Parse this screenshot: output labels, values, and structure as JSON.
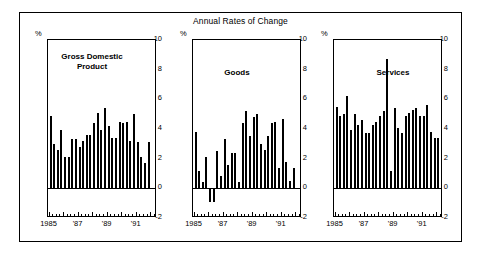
{
  "figure": {
    "title": "Annual Rates of Change",
    "axis_unit_label": "%"
  },
  "chart_data": [
    {
      "type": "bar",
      "title": "Gross Domestic Product",
      "panel_label": "Gross Domestic\nProduct",
      "xlabel": "",
      "ylabel": "%",
      "ylim": [
        -2,
        10
      ],
      "yticks": [
        -2,
        0,
        2,
        4,
        6,
        8,
        10
      ],
      "ytick_labels": [
        "-2",
        "0",
        "2",
        "4",
        "6",
        "8",
        "10"
      ],
      "xlim": [
        1985.0,
        1992.5
      ],
      "xtick_labels": [
        "1985",
        "'87",
        "'89",
        "'91"
      ],
      "xtick_values": [
        1985,
        1987,
        1989,
        1991
      ],
      "grid": false,
      "legend": "none",
      "x": [
        1985.0,
        1985.25,
        1985.5,
        1985.75,
        1986.0,
        1986.25,
        1986.5,
        1986.75,
        1987.0,
        1987.25,
        1987.5,
        1987.75,
        1988.0,
        1988.25,
        1988.5,
        1988.75,
        1989.0,
        1989.25,
        1989.5,
        1989.75,
        1990.0,
        1990.25,
        1990.5,
        1990.75,
        1991.0,
        1991.25,
        1991.5,
        1991.75,
        1992.0,
        1992.25
      ],
      "values": [
        4.9,
        3.0,
        2.6,
        3.9,
        2.1,
        2.1,
        3.3,
        3.3,
        2.8,
        3.2,
        3.6,
        3.6,
        4.4,
        5.1,
        3.9,
        5.4,
        4.2,
        3.4,
        3.4,
        4.5,
        4.4,
        4.5,
        3.2,
        5.0,
        3.1,
        2.1,
        1.7,
        3.1,
        0,
        0
      ]
    },
    {
      "type": "bar",
      "title": "Goods",
      "panel_label": "Goods",
      "xlabel": "",
      "ylabel": "%",
      "ylim": [
        -2,
        10
      ],
      "yticks": [
        -2,
        0,
        2,
        4,
        6,
        8,
        10
      ],
      "ytick_labels": [
        "-2",
        "0",
        "2",
        "4",
        "6",
        "8",
        "10"
      ],
      "xlim": [
        1985.0,
        1992.5
      ],
      "xtick_labels": [
        "1985",
        "'87",
        "'89",
        "'91"
      ],
      "xtick_values": [
        1985,
        1987,
        1989,
        1991
      ],
      "grid": false,
      "legend": "none",
      "x": [
        1985.0,
        1985.25,
        1985.5,
        1985.75,
        1986.0,
        1986.25,
        1986.5,
        1986.75,
        1987.0,
        1987.25,
        1987.5,
        1987.75,
        1988.0,
        1988.25,
        1988.5,
        1988.75,
        1989.0,
        1989.25,
        1989.5,
        1989.75,
        1990.0,
        1990.25,
        1990.5,
        1990.75,
        1991.0,
        1991.25,
        1991.5,
        1991.75,
        1992.0,
        1992.25
      ],
      "values": [
        3.8,
        1.2,
        0.4,
        2.1,
        -0.9,
        -0.9,
        2.5,
        0.8,
        3.3,
        1.6,
        2.4,
        2.4,
        0.4,
        4.4,
        5.2,
        3.5,
        4.8,
        5.0,
        3.0,
        2.6,
        3.5,
        4.4,
        4.5,
        1.4,
        4.7,
        1.8,
        0.5,
        1.4,
        0,
        0
      ]
    },
    {
      "type": "bar",
      "title": "Services",
      "panel_label": "Services",
      "xlabel": "",
      "ylabel": "%",
      "ylim": [
        -2,
        10
      ],
      "yticks": [
        -2,
        0,
        2,
        4,
        6,
        8,
        10
      ],
      "ytick_labels": [
        "-2",
        "0",
        "2",
        "4",
        "6",
        "8",
        "10"
      ],
      "xlim": [
        1985.0,
        1992.5
      ],
      "xtick_labels": [
        "1985",
        "'87",
        "'89",
        "'91"
      ],
      "xtick_values": [
        1985,
        1987,
        1989,
        1991
      ],
      "grid": false,
      "legend": "none",
      "x": [
        1985.0,
        1985.25,
        1985.5,
        1985.75,
        1986.0,
        1986.25,
        1986.5,
        1986.75,
        1987.0,
        1987.25,
        1987.5,
        1987.75,
        1988.0,
        1988.25,
        1988.5,
        1988.75,
        1989.0,
        1989.25,
        1989.5,
        1989.75,
        1990.0,
        1990.25,
        1990.5,
        1990.75,
        1991.0,
        1991.25,
        1991.5,
        1991.75,
        1992.0,
        1992.25
      ],
      "values": [
        5.5,
        4.9,
        5.0,
        6.2,
        3.9,
        5.0,
        4.3,
        4.6,
        3.7,
        3.7,
        4.3,
        4.5,
        4.9,
        5.2,
        8.7,
        1.2,
        5.4,
        4.1,
        3.7,
        4.9,
        5.1,
        5.3,
        5.4,
        4.9,
        4.9,
        5.6,
        3.8,
        3.4,
        3.4,
        5.0
      ]
    }
  ],
  "colors": {
    "bar": "#000000",
    "axis": "#000000",
    "background": "#ffffff"
  }
}
